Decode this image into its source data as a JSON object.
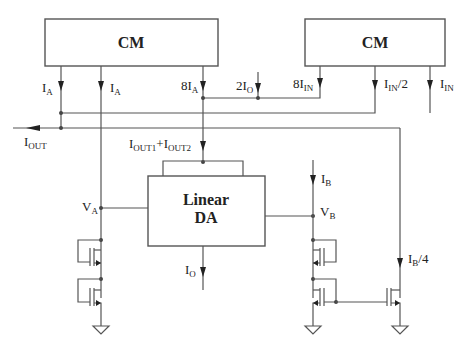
{
  "diagram": {
    "blocks": {
      "cm_left": {
        "label": "CM"
      },
      "cm_right": {
        "label": "CM"
      },
      "linear_da": {
        "line1": "Linear",
        "line2": "DA"
      }
    },
    "currents": {
      "ia_1": {
        "main": "I",
        "sub": "A"
      },
      "ia_2": {
        "main": "I",
        "sub": "A"
      },
      "eight_ia": {
        "main": "8I",
        "sub": "A"
      },
      "two_io": {
        "main": "2I",
        "sub": "O"
      },
      "eight_iin": {
        "main": "8I",
        "sub": "IN"
      },
      "iin_half": {
        "main": "I",
        "sub": "IN",
        "suffix": "/2"
      },
      "iin": {
        "main": "I",
        "sub": "IN"
      },
      "iout": {
        "main": "I",
        "sub": "OUT"
      },
      "iout_sum": {
        "main1": "I",
        "sub1": "OUT1",
        "plus": "+I",
        "sub2": "OUT2"
      },
      "ib": {
        "main": "I",
        "sub": "B"
      },
      "ib_quarter": {
        "main": "I",
        "sub": "B",
        "suffix": "/4"
      },
      "io": {
        "main": "I",
        "sub": "O"
      }
    },
    "nodes": {
      "va": {
        "main": "V",
        "sub": "A"
      },
      "vb": {
        "main": "V",
        "sub": "B"
      }
    }
  }
}
